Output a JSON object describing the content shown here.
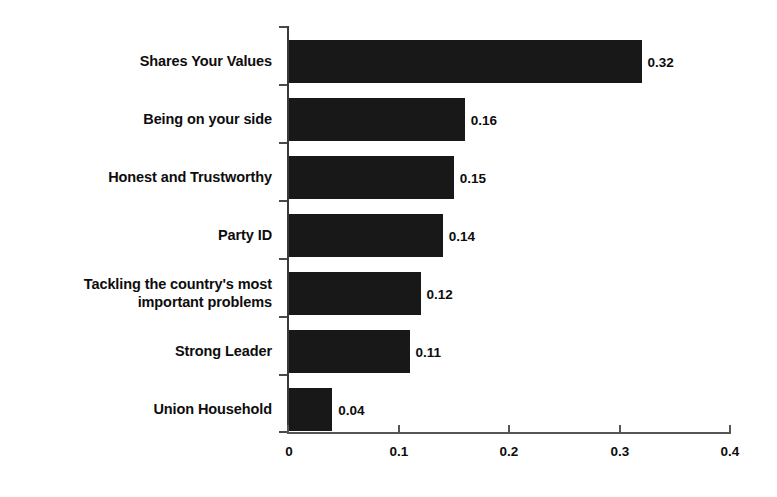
{
  "chart_data": {
    "type": "bar",
    "orientation": "horizontal",
    "title": "",
    "subtitle": "",
    "xlabel": "",
    "ylabel": "",
    "categories": [
      "Shares Your Values",
      "Being on your side",
      "Honest and Trustworthy",
      "Party ID",
      "Tackling the country's most\nimportant problems",
      "Strong Leader",
      "Union Household"
    ],
    "values": [
      0.32,
      0.16,
      0.15,
      0.14,
      0.12,
      0.11,
      0.04
    ],
    "value_labels": [
      "0.32",
      "0.16",
      "0.15",
      "0.14",
      "0.12",
      "0.11",
      "0.04"
    ],
    "xlim": [
      0,
      0.4
    ],
    "xticks": [
      0,
      0.1,
      0.2,
      0.3,
      0.4
    ],
    "xtick_labels": [
      "0",
      "0.1",
      "0.2",
      "0.3",
      "0.4"
    ],
    "grid": false,
    "legend": null,
    "bar_color": "#181818",
    "axis_color": "#555555",
    "text_color": "#0d0d0d",
    "background_color": "#ffffff"
  }
}
